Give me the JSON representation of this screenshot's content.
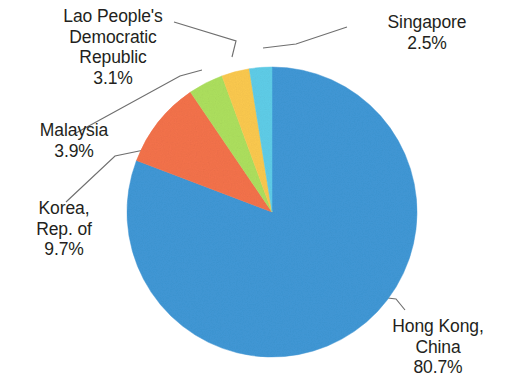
{
  "chart_data": {
    "type": "pie",
    "title": "",
    "subtitle": "",
    "xlabel": "",
    "ylabel": "",
    "legend_position": "none",
    "grid": false,
    "units": "percent",
    "start_angle_deg": -90,
    "direction": "clockwise",
    "categories": [
      "Hong Kong, China",
      "Korea, Rep. of",
      "Malaysia",
      "Lao People's Democratic Republic",
      "Singapore"
    ],
    "values": [
      80.7,
      9.7,
      3.9,
      3.1,
      2.5
    ],
    "colors": [
      "#4098d6",
      "#f4724b",
      "#ade05e",
      "#fbc94f",
      "#5fcde8"
    ],
    "slices": [
      {
        "name": "Hong Kong, China",
        "value": 80.7,
        "value_label": "80.7%",
        "color": "#4098d6",
        "label_lines": [
          "Hong Kong,",
          "China",
          "80.7%"
        ]
      },
      {
        "name": "Korea, Rep. of",
        "value": 9.7,
        "value_label": "9.7%",
        "color": "#f4724b",
        "label_lines": [
          "Korea,",
          "Rep. of",
          "9.7%"
        ]
      },
      {
        "name": "Malaysia",
        "value": 3.9,
        "value_label": "3.9%",
        "color": "#ade05e",
        "label_lines": [
          "Malaysia",
          "3.9%"
        ]
      },
      {
        "name": "Lao People's Democratic Republic",
        "value": 3.1,
        "value_label": "3.1%",
        "color": "#fbc94f",
        "label_lines": [
          "Lao People's",
          "Democratic",
          "Republic",
          "3.1%"
        ]
      },
      {
        "name": "Singapore",
        "value": 2.5,
        "value_label": "2.5%",
        "color": "#5fcde8",
        "label_lines": [
          "Singapore",
          "2.5%"
        ]
      }
    ]
  },
  "labels": {
    "lao": "Lao People's\nDemocratic\nRepublic\n3.1%",
    "singapore": "Singapore\n2.5%",
    "malaysia": "Malaysia\n3.9%",
    "korea": "Korea,\nRep. of\n9.7%",
    "hongkong": "Hong Kong,\nChina\n80.7%"
  },
  "style": {
    "background": "#ffffff",
    "text_color": "#231f20",
    "leader_line_color": "#6f6f6f"
  }
}
